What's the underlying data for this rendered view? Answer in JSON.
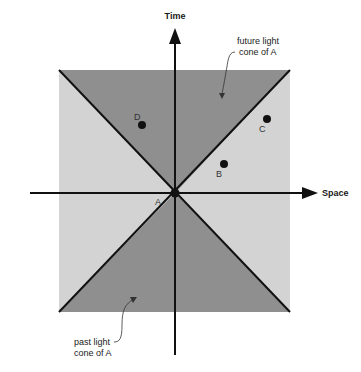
{
  "diagram": {
    "axes": {
      "time_label": "Time",
      "space_label": "Space"
    },
    "regions": {
      "future_cone_label_line1": "future light",
      "future_cone_label_line2": "cone of A",
      "past_cone_label_line1": "past light",
      "past_cone_label_line2": "cone of A"
    },
    "points": [
      {
        "id": "A",
        "label": "A"
      },
      {
        "id": "B",
        "label": "B"
      },
      {
        "id": "C",
        "label": "C"
      },
      {
        "id": "D",
        "label": "D"
      }
    ],
    "colors": {
      "cone_fill": "#8f8f8f",
      "outside_fill": "#d3d3d3",
      "line": "#111111",
      "background": "#ffffff"
    }
  }
}
